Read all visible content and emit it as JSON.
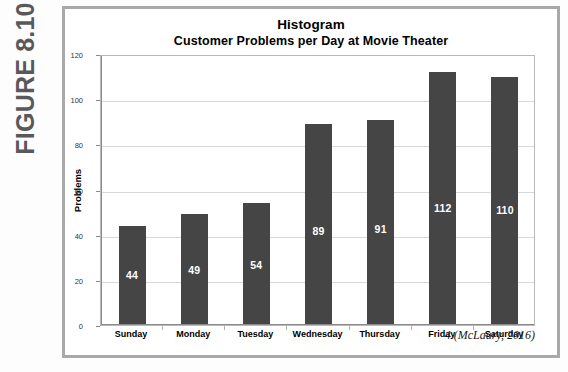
{
  "figure": {
    "tab_label": "FIGURE 8.10",
    "citation": "4 (McLaury, 2016)"
  },
  "chart_data": {
    "type": "bar",
    "title": "Histogram",
    "subtitle": "Customer Problems per Day at Movie Theater",
    "xlabel": "",
    "ylabel": "Problems",
    "categories": [
      "Sunday",
      "Monday",
      "Tuesday",
      "Wednesday",
      "Thursday",
      "Friday",
      "Saturday"
    ],
    "values": [
      44,
      49,
      54,
      89,
      91,
      112,
      110
    ],
    "value_labels": [
      "44",
      "49",
      "54",
      "89",
      "91",
      "112",
      "110"
    ],
    "ylim": [
      0,
      120
    ],
    "yticks": [
      0,
      20,
      40,
      60,
      80,
      100,
      120
    ],
    "ytick_labels": [
      "0",
      "20",
      "40",
      "60",
      "80",
      "100",
      "120"
    ],
    "grid": true,
    "grid_axis": "y",
    "legend": false,
    "bar_color": "#454545",
    "value_label_color": "#ffffff",
    "gridline_color": "#d8d8d8",
    "plot_border_color": "#b8b8b8"
  }
}
